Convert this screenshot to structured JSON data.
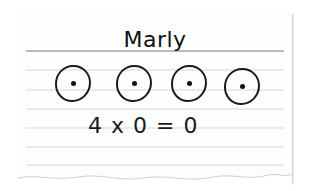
{
  "card": {
    "name": "Marly",
    "groups": [
      {
        "label": "group-1",
        "dots": 1
      },
      {
        "label": "group-2",
        "dots": 1
      },
      {
        "label": "group-3",
        "dots": 1
      },
      {
        "label": "group-4",
        "dots": 1
      }
    ],
    "equation": "4 x 0 = 0"
  },
  "colors": {
    "paper": "#fdfdfd",
    "ink": "#1a1a1a",
    "rule_dark": "#7a7a7a",
    "rule_light": "#d6d6d6"
  }
}
